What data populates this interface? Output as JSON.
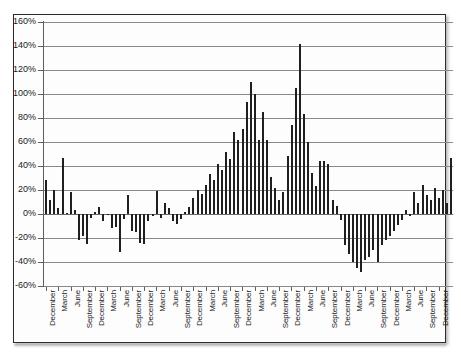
{
  "figure": {
    "background_color": "#ffffff",
    "frame_color": "#2b2b2b",
    "bar_color": "#1f1f1f",
    "grid_color": "#8a8a8a",
    "axis_color": "#5e5e5e"
  },
  "chart_data": {
    "type": "bar",
    "title": "",
    "subtitle": "",
    "xlabel": "",
    "ylabel": "",
    "ylim": [
      -60,
      160
    ],
    "ytick_values": [
      160,
      140,
      120,
      100,
      80,
      60,
      40,
      20,
      0,
      -20,
      -40,
      -60
    ],
    "ytick_labels": [
      "160%",
      "140%",
      "120%",
      "100%",
      "80%",
      "60%",
      "40%",
      "20%",
      "0%",
      "-20%",
      "-40%",
      "-60%"
    ],
    "grid": true,
    "grid_axis": "y",
    "legend": false,
    "legend_position": "none",
    "value_unit": "percent",
    "tick_label_cycle": [
      "December",
      "March",
      "June",
      "September"
    ],
    "xtick_labels": [
      "December",
      "March",
      "June",
      "September",
      "December",
      "March",
      "June",
      "September",
      "December",
      "March",
      "June",
      "September",
      "December",
      "March",
      "June",
      "September",
      "December",
      "March",
      "June",
      "September",
      "December",
      "March",
      "June",
      "September",
      "December",
      "March",
      "June",
      "September",
      "December",
      "March",
      "June",
      "September",
      "December"
    ],
    "values": [
      28,
      12,
      20,
      5,
      47,
      1,
      18,
      3,
      -22,
      -18,
      -25,
      -3,
      2,
      6,
      -6,
      -1,
      -12,
      -11,
      -32,
      -4,
      16,
      -14,
      -15,
      -24,
      -25,
      -6,
      -2,
      19,
      -3,
      9,
      5,
      -6,
      -8,
      -4,
      2,
      6,
      13,
      20,
      17,
      24,
      33,
      28,
      42,
      37,
      52,
      46,
      68,
      62,
      71,
      93,
      110,
      100,
      62,
      85,
      62,
      31,
      22,
      12,
      18,
      48,
      74,
      105,
      142,
      83,
      60,
      34,
      23,
      44,
      44,
      42,
      12,
      7,
      -5,
      -26,
      -33,
      -40,
      -45,
      -48,
      -38,
      -36,
      -30,
      -40,
      -26,
      -22,
      -18,
      -14,
      -9,
      -5,
      3,
      -2,
      18,
      9,
      24,
      16,
      12,
      22,
      13,
      20,
      9,
      47
    ]
  }
}
